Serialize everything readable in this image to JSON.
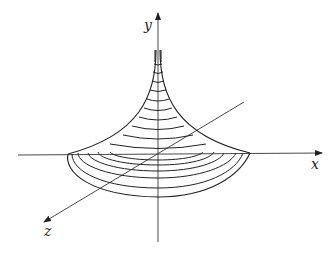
{
  "diagram": {
    "type": "3d-surface-sketch",
    "axes": {
      "x": {
        "label": "x"
      },
      "y": {
        "label": "y"
      },
      "z": {
        "label": "z"
      }
    },
    "colors": {
      "stroke": "#222222",
      "background": "#ffffff"
    },
    "level_curves_count": 11
  }
}
